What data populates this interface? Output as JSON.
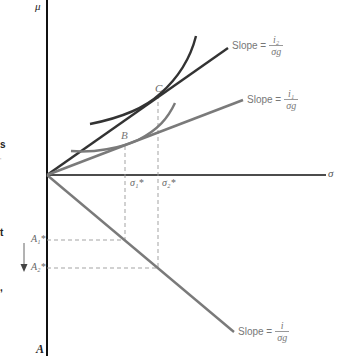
{
  "figure": {
    "axes": {
      "y_top_label": "μ",
      "x_right_label": "σ",
      "y_bottom_label": "A"
    },
    "lines": [
      {
        "name": "slope-i2-line",
        "label_prefix": "Slope =",
        "numerator": "i₂",
        "denominator": "σg",
        "color": "#333333"
      },
      {
        "name": "slope-i1-line",
        "label_prefix": "Slope =",
        "numerator": "i₁",
        "denominator": "σg",
        "color": "#777777"
      },
      {
        "name": "slope-i-line",
        "label_prefix": "Slope =",
        "numerator": "i",
        "denominator": "σg",
        "color": "#888888"
      }
    ],
    "points": {
      "B": "B",
      "C": "C"
    },
    "x_ticks": [
      "σ₁*",
      "σ₂*"
    ],
    "y_ticks": [
      "A₁*",
      "A₂*"
    ],
    "colors": {
      "axis": "#111111",
      "dark_line": "#333333",
      "mid_line": "#7a7a7a",
      "dashed": "#999999",
      "label": "#777777"
    }
  },
  "margin_fragments": [
    "s",
    "t",
    ",",
    "'"
  ]
}
